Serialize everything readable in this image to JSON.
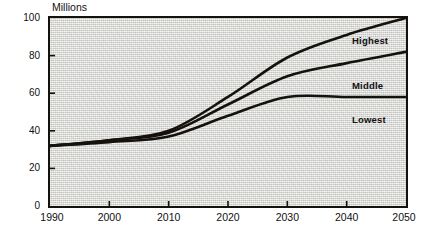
{
  "chart_data": {
    "type": "line",
    "title": "",
    "subtitle": "",
    "xlabel": "",
    "ylabel": "Millions",
    "xlim": [
      1990,
      2050
    ],
    "ylim": [
      0,
      100
    ],
    "grid": false,
    "legend_position": "inline-right",
    "x_ticks": [
      "1990",
      "2000",
      "2010",
      "2020",
      "2030",
      "2040",
      "2050"
    ],
    "y_ticks": [
      "0",
      "20",
      "40",
      "60",
      "80",
      "100"
    ],
    "x": [
      1990,
      2000,
      2010,
      2020,
      2030,
      2040,
      2050
    ],
    "series": [
      {
        "name": "Highest",
        "values": [
          32,
          35,
          40,
          58,
          79,
          91,
          100
        ]
      },
      {
        "name": "Middle",
        "values": [
          32,
          35,
          39,
          54,
          69,
          76,
          82
        ]
      },
      {
        "name": "Lowest",
        "values": [
          32,
          34,
          37,
          48,
          58,
          58,
          58
        ]
      }
    ],
    "annotations": [
      {
        "text": "Highest",
        "series": "Highest"
      },
      {
        "text": "Middle",
        "series": "Middle"
      },
      {
        "text": "Lowest",
        "series": "Lowest"
      }
    ],
    "colors": {
      "line": "#15110d",
      "plot_background": "#d9d9d6",
      "frame": "#15110d"
    }
  },
  "axes": {
    "y_title": "Millions",
    "y_ticks": [
      {
        "label": "100",
        "value": 100
      },
      {
        "label": "80",
        "value": 80
      },
      {
        "label": "60",
        "value": 60
      },
      {
        "label": "40",
        "value": 40
      },
      {
        "label": "20",
        "value": 20
      },
      {
        "label": "0",
        "value": 0
      }
    ],
    "x_ticks": [
      {
        "label": "1990",
        "value": 1990
      },
      {
        "label": "2000",
        "value": 2000
      },
      {
        "label": "2010",
        "value": 2010
      },
      {
        "label": "2020",
        "value": 2020
      },
      {
        "label": "2030",
        "value": 2030
      },
      {
        "label": "2040",
        "value": 2040
      },
      {
        "label": "2050",
        "value": 2050
      }
    ]
  },
  "labels": {
    "highest": "Highest",
    "middle": "Middle",
    "lowest": "Lowest"
  }
}
